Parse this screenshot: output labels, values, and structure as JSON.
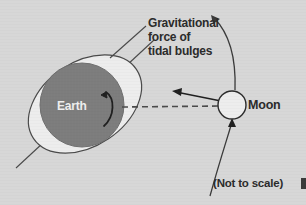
{
  "figure": {
    "background_color": "#d7d7d7",
    "stroke_color": "#2b2b2b"
  },
  "labels": {
    "force_line1": "Gravitational",
    "force_line2": "force of",
    "force_line3": "tidal bulges",
    "earth": "Earth",
    "moon": "Moon",
    "not_to_scale": "(Not to scale)"
  },
  "bodies": {
    "earth": {
      "name": "Earth",
      "fill_color": "#7d7d7d",
      "label_color": "#efefef",
      "center_x": 82,
      "center_y": 105,
      "radius": 42
    },
    "moon": {
      "name": "Moon",
      "fill_color": "#ededed",
      "center_x": 232,
      "center_y": 105,
      "radius": 14
    },
    "tidal_bulge": {
      "name": "tidal bulge ellipse",
      "fill_color": "#eeeeee",
      "center_x": 85,
      "center_y": 104,
      "rx": 62,
      "ry": 42,
      "rotation_deg": -34
    }
  },
  "annotations": {
    "force_arrow": "arrow from Moon toward Earth",
    "orbit_arc": "Moon orbital path arc with direction arrows",
    "rotation_arrow": "Earth rotation curved arrow",
    "leader_line": "leader line from gravitational force label to tidal bulge"
  }
}
